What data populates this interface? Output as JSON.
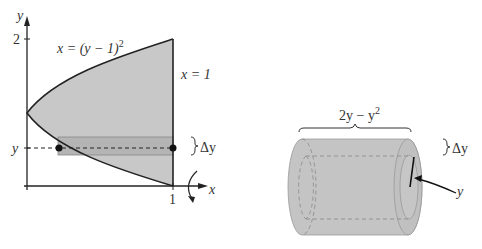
{
  "left_figure": {
    "y_axis_label": "y",
    "x_axis_label": "x",
    "y_tick_label": "2",
    "x_tick_label": "1",
    "curve_label": "x = (y − 1)²",
    "curve_label_parts": {
      "lhs": "x = (y − 1)",
      "sup": "2"
    },
    "line_label": "x = 1",
    "y_marker_label": "y",
    "delta_label": "Δy"
  },
  "right_figure": {
    "width_label_parts": {
      "base": "2y − y",
      "sup": "2"
    },
    "delta_label": "Δy",
    "radius_label": "y"
  },
  "colors": {
    "region_fill": "#c8c8c8",
    "strip_fill": "#b4b4b4",
    "cylinder_fill": "#c4c4c4",
    "line": "#222222"
  }
}
